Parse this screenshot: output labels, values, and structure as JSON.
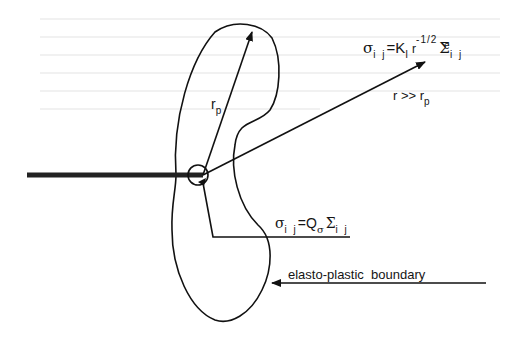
{
  "diagram": {
    "labels": {
      "plastic_radius": {
        "main": "r",
        "sub": "p"
      },
      "far_field": {
        "text": "r >> r",
        "sub": "p"
      },
      "elastic_stress": {
        "sigma": "σ",
        "sigma_sub": "i j",
        "eq": "=",
        "K": "K",
        "K_sub": "I",
        "r": "r",
        "r_sup": "-1/2",
        "Sigma": "Σ",
        "Sigma_sup": "e",
        "Sigma_sub": "i j"
      },
      "plastic_stress": {
        "sigma": "σ",
        "sigma_sub": "i j",
        "eq": "=",
        "Q": "Q",
        "Q_sub": "σ",
        "Sigma": "Σ",
        "Sigma_sub": "i j"
      },
      "boundary": "elasto-plastic  boundary"
    },
    "colors": {
      "line": "#111111",
      "background": "#ffffff"
    }
  }
}
